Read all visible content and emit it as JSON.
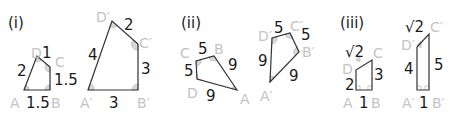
{
  "parts": [
    {
      "label": "(i)",
      "small": {
        "vertices": {
          "A": "A",
          "B": "B",
          "C": "C",
          "D": "D"
        },
        "sides": {
          "AB": "1.5",
          "BC": "1.5",
          "CD": "1",
          "DA": "2"
        }
      },
      "large": {
        "vertices": {
          "A": "A′",
          "B": "B′",
          "C": "C′",
          "D": "D′"
        },
        "sides": {
          "AB": "3",
          "BC": "3",
          "CD": "2",
          "DA": "4"
        }
      }
    },
    {
      "label": "(ii)",
      "small": {
        "vertices": {
          "A": "A",
          "B": "B",
          "C": "C",
          "D": "D"
        },
        "sides": {
          "AB": "9",
          "BC": "5",
          "CD": "5",
          "DA": "9"
        }
      },
      "large": {
        "vertices": {
          "A": "A′",
          "B": "B′",
          "C": "C′",
          "D": "D′"
        },
        "sides": {
          "AB": "9",
          "BC": "5",
          "CD": "5",
          "DA": "9"
        }
      }
    },
    {
      "label": "(iii)",
      "small": {
        "vertices": {
          "A": "A",
          "B": "B",
          "C": "C",
          "D": "D"
        },
        "sides": {
          "AB": "1",
          "BC": "3",
          "CD": "√2",
          "DA": "2"
        }
      },
      "large": {
        "vertices": {
          "A": "A′",
          "B": "B′",
          "C": "C′",
          "D": "D′"
        },
        "sides": {
          "AB": "1",
          "BC": "5",
          "CD": "√2",
          "DA": "4"
        }
      }
    }
  ],
  "colors": {
    "text": "#1a1a1a",
    "vertex_label": "#c4c4c4",
    "stroke": "#333333",
    "angle_fill": "#d8d8d8"
  }
}
